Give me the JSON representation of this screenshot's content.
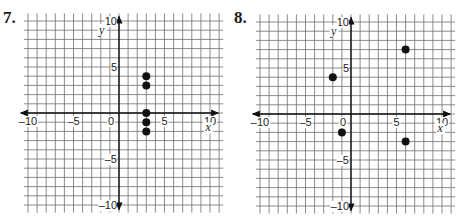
{
  "problems": [
    {
      "number": "7."
    },
    {
      "number": "8."
    }
  ],
  "chart_data": [
    {
      "type": "scatter",
      "title": "7.",
      "xlabel": "x",
      "ylabel": "y",
      "xlim": [
        -10,
        10
      ],
      "ylim": [
        -10,
        10
      ],
      "grid": true,
      "x_ticks": [
        "-10",
        "-5",
        "0",
        "5",
        "10"
      ],
      "y_ticks": [
        "10",
        "5",
        "-5",
        "-10"
      ],
      "points": [
        [
          3,
          4
        ],
        [
          3,
          3
        ],
        [
          3,
          0
        ],
        [
          3,
          -1
        ],
        [
          3,
          -2
        ]
      ]
    },
    {
      "type": "scatter",
      "title": "8.",
      "xlabel": "x",
      "ylabel": "y",
      "xlim": [
        -10,
        10
      ],
      "ylim": [
        -10,
        10
      ],
      "grid": true,
      "x_ticks": [
        "-10",
        "-5",
        "0",
        "5",
        "10"
      ],
      "y_ticks": [
        "10",
        "5",
        "-5",
        "-10"
      ],
      "points": [
        [
          -2,
          4
        ],
        [
          -1,
          -2
        ],
        [
          6,
          7
        ],
        [
          6,
          -3
        ]
      ]
    }
  ]
}
